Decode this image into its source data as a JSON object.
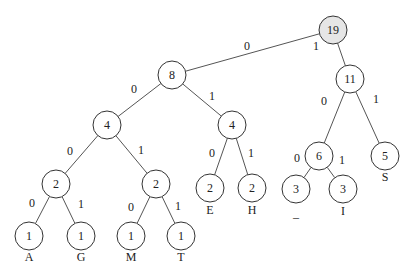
{
  "diagram": {
    "type": "huffman-tree",
    "nodes": [
      {
        "id": "n19",
        "weight": "19",
        "x": 333,
        "y": 30,
        "root": true
      },
      {
        "id": "n8",
        "weight": "8",
        "x": 172,
        "y": 75
      },
      {
        "id": "n11",
        "weight": "11",
        "x": 350,
        "y": 79
      },
      {
        "id": "n4a",
        "weight": "4",
        "x": 107,
        "y": 125
      },
      {
        "id": "n4b",
        "weight": "4",
        "x": 232,
        "y": 125
      },
      {
        "id": "n6",
        "weight": "6",
        "x": 319,
        "y": 156
      },
      {
        "id": "n5",
        "weight": "5",
        "x": 385,
        "y": 156
      },
      {
        "id": "n2a",
        "weight": "2",
        "x": 56,
        "y": 184
      },
      {
        "id": "n2b",
        "weight": "2",
        "x": 156,
        "y": 184
      },
      {
        "id": "n2e",
        "weight": "2",
        "x": 210,
        "y": 188,
        "symbol": "E"
      },
      {
        "id": "n2h",
        "weight": "2",
        "x": 252,
        "y": 188,
        "symbol": "H"
      },
      {
        "id": "n3u",
        "weight": "3",
        "x": 296,
        "y": 189,
        "symbol": "_"
      },
      {
        "id": "n3i",
        "weight": "3",
        "x": 343,
        "y": 189,
        "symbol": "I"
      },
      {
        "id": "n1a",
        "weight": "1",
        "x": 29,
        "y": 236,
        "symbol": "A"
      },
      {
        "id": "n1g",
        "weight": "1",
        "x": 81,
        "y": 236,
        "symbol": "G"
      },
      {
        "id": "n1m",
        "weight": "1",
        "x": 131,
        "y": 236,
        "symbol": "M"
      },
      {
        "id": "n1t",
        "weight": "1",
        "x": 181,
        "y": 236,
        "symbol": "T"
      }
    ],
    "edges": [
      {
        "from": "n19",
        "to": "n8",
        "bit": "0",
        "lx": 247,
        "ly": 46
      },
      {
        "from": "n19",
        "to": "n11",
        "bit": "1",
        "lx": 316,
        "ly": 46
      },
      {
        "from": "n8",
        "to": "n4a",
        "bit": "0",
        "lx": 134,
        "ly": 89
      },
      {
        "from": "n8",
        "to": "n4b",
        "bit": "1",
        "lx": 212,
        "ly": 96
      },
      {
        "from": "n11",
        "to": "n6",
        "bit": "0",
        "lx": 324,
        "ly": 101
      },
      {
        "from": "n11",
        "to": "n5",
        "bit": "1",
        "lx": 376,
        "ly": 99
      },
      {
        "from": "n4a",
        "to": "n2a",
        "bit": "0",
        "lx": 70,
        "ly": 151
      },
      {
        "from": "n4a",
        "to": "n2b",
        "bit": "1",
        "lx": 141,
        "ly": 150
      },
      {
        "from": "n4b",
        "to": "n2e",
        "bit": "0",
        "lx": 212,
        "ly": 153
      },
      {
        "from": "n4b",
        "to": "n2h",
        "bit": "1",
        "lx": 251,
        "ly": 153
      },
      {
        "from": "n6",
        "to": "n3u",
        "bit": "0",
        "lx": 297,
        "ly": 158
      },
      {
        "from": "n6",
        "to": "n3i",
        "bit": "1",
        "lx": 342,
        "ly": 160
      },
      {
        "from": "n2a",
        "to": "n1a",
        "bit": "0",
        "lx": 32,
        "ly": 203
      },
      {
        "from": "n2a",
        "to": "n1g",
        "bit": "1",
        "lx": 81,
        "ly": 204
      },
      {
        "from": "n2b",
        "to": "n1m",
        "bit": "0",
        "lx": 131,
        "ly": 207
      },
      {
        "from": "n2b",
        "to": "n1t",
        "bit": "1",
        "lx": 178,
        "ly": 206
      }
    ],
    "leaf_labels": [
      {
        "symbol": "A",
        "x": 29,
        "y": 257
      },
      {
        "symbol": "G",
        "x": 81,
        "y": 257
      },
      {
        "symbol": "M",
        "x": 131,
        "y": 257
      },
      {
        "symbol": "T",
        "x": 181,
        "y": 257
      },
      {
        "symbol": "E",
        "x": 210,
        "y": 210
      },
      {
        "symbol": "H",
        "x": 252,
        "y": 210
      },
      {
        "symbol": "_",
        "x": 296,
        "y": 213
      },
      {
        "symbol": "I",
        "x": 343,
        "y": 211
      },
      {
        "symbol": "S",
        "x": 385,
        "y": 177
      }
    ],
    "radius": 14,
    "root_fill": "#e6e6e6"
  }
}
